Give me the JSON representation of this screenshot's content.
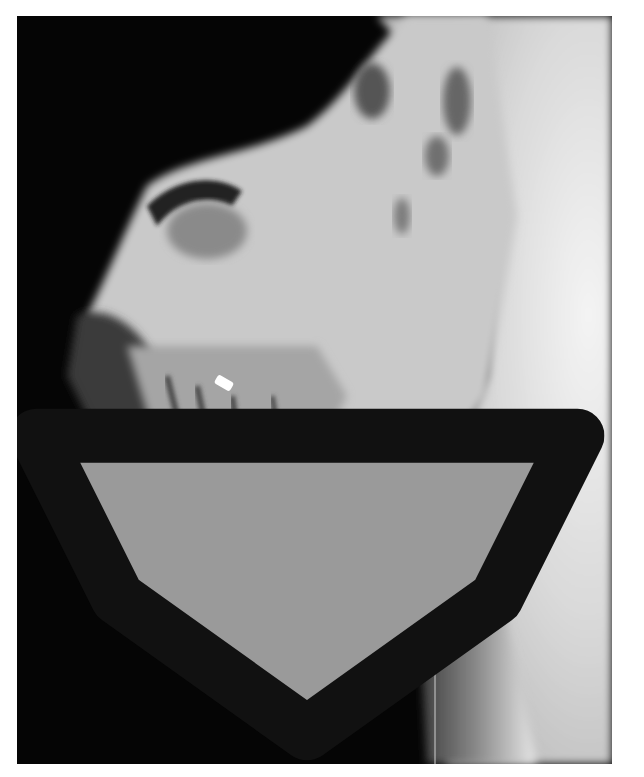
{
  "figure": {
    "background_color": "#050505",
    "labels": [
      {
        "id": "1",
        "text": "1",
        "x": 523,
        "y": 573
      },
      {
        "id": "2",
        "text": "2",
        "x": 376,
        "y": 474
      },
      {
        "id": "3",
        "text": "3",
        "x": 385,
        "y": 573
      },
      {
        "id": "4",
        "text": "4",
        "x": 340,
        "y": 634
      },
      {
        "id": "5",
        "text": "5",
        "x": 220,
        "y": 538
      },
      {
        "id": "6",
        "text": "6",
        "x": 309,
        "y": 552
      }
    ],
    "arrow": {
      "type": "open-arrow-pointing-down",
      "x": 307,
      "y": 571
    }
  }
}
